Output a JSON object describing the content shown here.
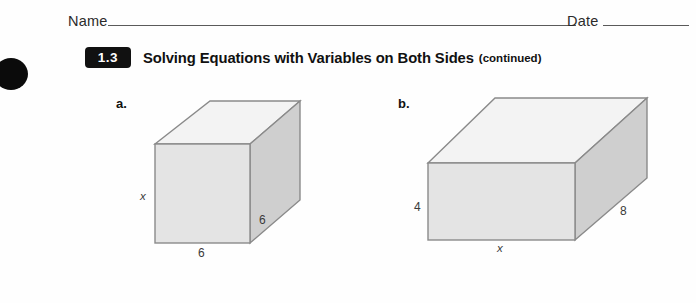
{
  "worksheet": {
    "name_field": {
      "label": "Name"
    },
    "date_field": {
      "label": "Date"
    },
    "lesson": {
      "number": "1.3",
      "title": "Solving Equations with Variables on Both Sides",
      "continued": "(continued)"
    }
  },
  "figures": [
    {
      "letter": "a.",
      "shape": "rectangular-prism",
      "labels": {
        "height": "x",
        "width": "6",
        "depth": "6"
      }
    },
    {
      "letter": "b.",
      "shape": "rectangular-prism",
      "labels": {
        "height": "4",
        "width": "x",
        "depth": "8"
      }
    }
  ],
  "colors": {
    "badge_background": "#111111",
    "badge_text": "#ffffff",
    "rule_line": "#5a5a5a",
    "face_top": "#f3f3f3",
    "face_front": "#e4e4e4",
    "face_side": "#cfcfcf",
    "edge_stroke": "#8a8a8a",
    "punch_mark": "#0b0b0b"
  }
}
